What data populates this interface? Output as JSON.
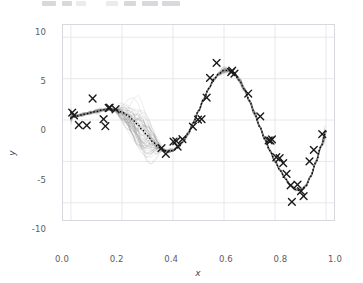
{
  "toolbar": {
    "visible": true,
    "note": "cropped matplotlib toolbar sliver"
  },
  "figure": {
    "background": "#ffffff",
    "grid_color": "#e8e8ec",
    "spine_color": "#d7d7dd",
    "marker_color": "#1a1a1a",
    "mean_line_color": "#000000",
    "sample_line_color": "#808080"
  },
  "chart_data": {
    "type": "line",
    "title": "",
    "xlabel": "x",
    "ylabel": "y",
    "xlim": [
      -0.035,
      1.035
    ],
    "ylim": [
      -12.2,
      11.6
    ],
    "xticks": [
      0.0,
      0.2,
      0.4,
      0.6,
      0.8,
      1.0
    ],
    "xticklabels": [
      "0.0",
      "0.2",
      "0.4",
      "0.6",
      "0.8",
      "1.0"
    ],
    "yticks": [
      10,
      5,
      0,
      -5,
      -10
    ],
    "yticklabels": [
      "10",
      "5",
      "0",
      "-5",
      "-10"
    ],
    "grid": true,
    "legend": null,
    "series": [
      {
        "name": "observations",
        "type": "scatter",
        "marker": "x",
        "color": "#1a1a1a",
        "points": [
          [
            0.005,
            0.9
          ],
          [
            0.012,
            0.55
          ],
          [
            0.031,
            -0.6
          ],
          [
            0.062,
            -0.65
          ],
          [
            0.085,
            2.6
          ],
          [
            0.128,
            0.1
          ],
          [
            0.135,
            -0.75
          ],
          [
            0.148,
            1.45
          ],
          [
            0.152,
            1.5
          ],
          [
            0.175,
            1.3
          ],
          [
            0.355,
            -3.4
          ],
          [
            0.372,
            -4.1
          ],
          [
            0.402,
            -2.6
          ],
          [
            0.413,
            -2.55
          ],
          [
            0.418,
            -3.2
          ],
          [
            0.437,
            -2.3
          ],
          [
            0.478,
            -0.8
          ],
          [
            0.498,
            0.05
          ],
          [
            0.512,
            0.1
          ],
          [
            0.532,
            2.7
          ],
          [
            0.545,
            5.1
          ],
          [
            0.571,
            6.9
          ],
          [
            0.628,
            5.8
          ],
          [
            0.632,
            5.95
          ],
          [
            0.641,
            5.6
          ],
          [
            0.695,
            3.2
          ],
          [
            0.742,
            0.45
          ],
          [
            0.775,
            -2.45
          ],
          [
            0.782,
            -2.5
          ],
          [
            0.788,
            -2.35
          ],
          [
            0.805,
            -4.5
          ],
          [
            0.818,
            -4.6
          ],
          [
            0.832,
            -5.2
          ],
          [
            0.845,
            -6.5
          ],
          [
            0.861,
            -7.9
          ],
          [
            0.866,
            -9.9
          ],
          [
            0.888,
            -7.8
          ],
          [
            0.902,
            -8.6
          ],
          [
            0.912,
            -9.2
          ],
          [
            0.935,
            -5.0
          ],
          [
            0.952,
            -3.6
          ],
          [
            0.985,
            -1.7
          ]
        ]
      },
      {
        "name": "posterior-mean",
        "type": "line",
        "style": "dotted",
        "color": "#000000",
        "points": [
          [
            0.0,
            0.35
          ],
          [
            0.02,
            0.45
          ],
          [
            0.04,
            0.6
          ],
          [
            0.06,
            0.75
          ],
          [
            0.08,
            0.9
          ],
          [
            0.1,
            1.05
          ],
          [
            0.12,
            1.2
          ],
          [
            0.14,
            1.3
          ],
          [
            0.16,
            1.3
          ],
          [
            0.18,
            1.2
          ],
          [
            0.2,
            0.95
          ],
          [
            0.22,
            0.6
          ],
          [
            0.24,
            0.1
          ],
          [
            0.26,
            -0.5
          ],
          [
            0.28,
            -1.2
          ],
          [
            0.3,
            -1.9
          ],
          [
            0.32,
            -2.6
          ],
          [
            0.34,
            -3.2
          ],
          [
            0.36,
            -3.6
          ],
          [
            0.38,
            -3.8
          ],
          [
            0.4,
            -3.7
          ],
          [
            0.42,
            -3.3
          ],
          [
            0.44,
            -2.6
          ],
          [
            0.46,
            -1.6
          ],
          [
            0.48,
            -0.3
          ],
          [
            0.5,
            1.1
          ],
          [
            0.52,
            2.5
          ],
          [
            0.54,
            3.8
          ],
          [
            0.56,
            4.9
          ],
          [
            0.58,
            5.6
          ],
          [
            0.6,
            6.0
          ],
          [
            0.62,
            6.0
          ],
          [
            0.64,
            5.6
          ],
          [
            0.66,
            4.8
          ],
          [
            0.68,
            3.7
          ],
          [
            0.7,
            2.3
          ],
          [
            0.72,
            0.8
          ],
          [
            0.74,
            -0.8
          ],
          [
            0.76,
            -2.3
          ],
          [
            0.78,
            -3.7
          ],
          [
            0.8,
            -5.0
          ],
          [
            0.82,
            -6.1
          ],
          [
            0.84,
            -7.1
          ],
          [
            0.86,
            -7.9
          ],
          [
            0.88,
            -8.4
          ],
          [
            0.9,
            -8.5
          ],
          [
            0.92,
            -8.0
          ],
          [
            0.94,
            -6.8
          ],
          [
            0.96,
            -5.1
          ],
          [
            0.98,
            -3.2
          ],
          [
            1.0,
            -1.4
          ]
        ]
      },
      {
        "name": "posterior-samples",
        "type": "line-ensemble",
        "color": "#808080",
        "count": 60,
        "description": "translucent grey posterior draws fanning around the mean"
      }
    ]
  }
}
